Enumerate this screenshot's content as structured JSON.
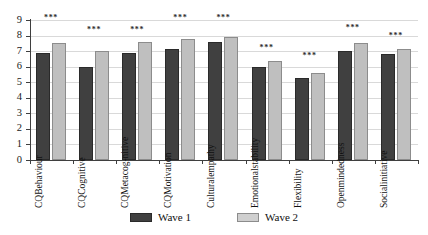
{
  "chart_data": {
    "type": "bar",
    "title": "",
    "xlabel": "",
    "ylabel": "",
    "ylim": [
      0,
      9
    ],
    "yticks": [
      "0",
      "1",
      "2",
      "3",
      "4",
      "5",
      "6",
      "7",
      "8",
      "9"
    ],
    "grid": true,
    "legend_position": "bottom",
    "categories": [
      "CQ Behaviour",
      "CQ Cognitive",
      "CQ Metacognitive",
      "CQ Motivation",
      "Cultural empathy",
      "Emotional stability",
      "Flexibility",
      "Open mindedness",
      "Social initiative"
    ],
    "category_lines": [
      [
        "CQ",
        "Behaviour"
      ],
      [
        "CQ",
        "Cognitive"
      ],
      [
        "CQ",
        "Metacog-",
        "nitive"
      ],
      [
        "CQ",
        "Motivation"
      ],
      [
        "Cultural",
        "empathy"
      ],
      [
        "Emotional",
        "stability"
      ],
      [
        "Flexibility"
      ],
      [
        "Open",
        "mindedness"
      ],
      [
        "Social",
        "initiative"
      ]
    ],
    "series": [
      {
        "name": "Wave 1",
        "color": "#404040",
        "values": [
          6.85,
          6.0,
          6.9,
          7.15,
          7.6,
          5.95,
          5.3,
          7.0,
          6.8
        ]
      },
      {
        "name": "Wave 2",
        "color": "#bfbfbf",
        "values": [
          7.55,
          7.0,
          7.6,
          7.75,
          7.9,
          6.35,
          5.6,
          7.5,
          7.15
        ]
      }
    ],
    "annotations": {
      "significance": [
        "***",
        "***",
        "***",
        "***",
        "***",
        "***",
        "***",
        "***",
        "***"
      ],
      "significance_y": [
        8.85,
        8.1,
        8.1,
        8.85,
        8.85,
        6.95,
        6.4,
        8.2,
        7.7
      ]
    }
  },
  "legend": {
    "items": [
      {
        "label": "Wave 1",
        "color": "#404040"
      },
      {
        "label": "Wave 2",
        "color": "#cfcfcf"
      }
    ]
  }
}
